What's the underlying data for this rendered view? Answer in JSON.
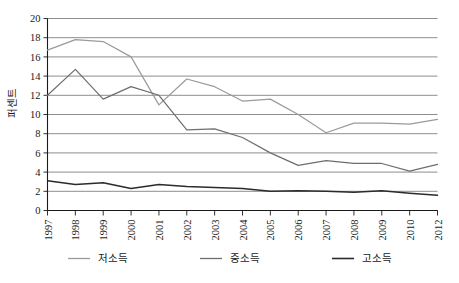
{
  "chart_data": {
    "type": "line",
    "title": "",
    "xlabel": "",
    "ylabel": "퍼센트",
    "categories": [
      "1997",
      "1998",
      "1999",
      "2000",
      "2001",
      "2002",
      "2003",
      "2004",
      "2005",
      "2006",
      "2007",
      "2008",
      "2009",
      "2010",
      "2012"
    ],
    "x_tick_labels": [
      "1997",
      "1998",
      "1999",
      "2000",
      "2001",
      "2002",
      "2003",
      "2004",
      "2005",
      "2006",
      "2007",
      "2008",
      "2009",
      "2010",
      "2012"
    ],
    "y_tick_labels": [
      "0",
      "2",
      "4",
      "6",
      "8",
      "10",
      "12",
      "14",
      "16",
      "18",
      "20"
    ],
    "y_ticks": [
      0,
      2,
      4,
      6,
      8,
      10,
      12,
      14,
      16,
      18,
      20
    ],
    "ylim": [
      0,
      20
    ],
    "grid": "horizontal",
    "legend_position": "bottom",
    "series": [
      {
        "name": "저소득",
        "color": "#9a9a9a",
        "values": [
          16.7,
          17.8,
          17.6,
          16.0,
          11.0,
          13.7,
          12.9,
          11.4,
          11.6,
          10.0,
          8.1,
          9.1,
          9.1,
          9.0,
          9.5
        ]
      },
      {
        "name": "중소득",
        "color": "#6e6e6e",
        "values": [
          12.0,
          14.7,
          11.6,
          12.9,
          12.0,
          8.4,
          8.5,
          7.6,
          6.0,
          4.7,
          5.2,
          4.9,
          4.9,
          4.1,
          4.8
        ]
      },
      {
        "name": "고소득",
        "color": "#2b2b2b",
        "values": [
          3.1,
          2.7,
          2.9,
          2.3,
          2.7,
          2.5,
          2.4,
          2.3,
          2.0,
          2.05,
          2.0,
          1.9,
          2.05,
          1.8,
          1.6
        ]
      }
    ]
  },
  "legend": {
    "items": [
      {
        "label": "저소득",
        "color": "#9a9a9a"
      },
      {
        "label": "중소득",
        "color": "#6e6e6e"
      },
      {
        "label": "고소득",
        "color": "#2b2b2b"
      }
    ]
  },
  "axes": {
    "y_axis_title": "퍼센트"
  },
  "colors": {
    "gridline": "#808080",
    "axis": "#1a1a1a",
    "background": "#ffffff"
  }
}
